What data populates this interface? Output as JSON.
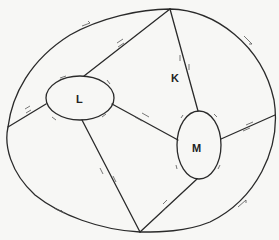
{
  "diagram": {
    "title": "",
    "regions": [
      {
        "id": "K",
        "label": "K",
        "x": 176,
        "y": 78
      },
      {
        "id": "L",
        "label": "L",
        "x": 81,
        "y": 102
      },
      {
        "id": "M",
        "label": "M",
        "x": 199,
        "y": 149
      }
    ],
    "inner_holes": [
      {
        "id": "L",
        "cx": 80,
        "cy": 98,
        "rx": 34,
        "ry": 22
      },
      {
        "id": "M",
        "cx": 199,
        "cy": 145,
        "rx": 22,
        "ry": 34
      }
    ],
    "vertices": {
      "top": [
        170,
        9
      ],
      "bottom": [
        140,
        232
      ],
      "left": [
        8,
        127
      ],
      "right": [
        275,
        115
      ]
    },
    "edges": [
      {
        "from": "top",
        "to": "L-top"
      },
      {
        "from": "top",
        "to": "M-top"
      },
      {
        "from": "L-left",
        "to": "outer-left"
      },
      {
        "from": "L-right",
        "to": "M-left"
      },
      {
        "from": "L-bottom",
        "to": "bottom"
      },
      {
        "from": "M-bottom",
        "to": "bottom"
      },
      {
        "from": "M-right",
        "to": "outer-right"
      }
    ],
    "edge_markings": "paired opposite arrows on each cut edge; single arrows along boundary arcs"
  },
  "colors": {
    "background": "#f7f7f5",
    "ink": "#2a2a2a"
  }
}
